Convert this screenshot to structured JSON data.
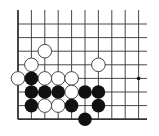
{
  "board": {
    "description": "Go problem diagram, lower-left corner section",
    "columns": 10,
    "rows": 8,
    "edges": {
      "left": true,
      "bottom": true,
      "top": false,
      "right": false
    },
    "origin_x": 18,
    "origin_y": 24,
    "spacing_x": 13.4,
    "spacing_y": 13.6,
    "line_top": 10,
    "line_right": 147,
    "stone_radius": 6.8,
    "colors": {
      "background": "#ffffff",
      "line": "#333333",
      "black_stone": "#111111",
      "white_stone_fill": "#ffffff",
      "white_stone_stroke": "#333333",
      "star_point": "#111111"
    },
    "star_points": [
      {
        "col": 9,
        "row": 4
      }
    ],
    "white_stones": [
      {
        "col": 2,
        "row": 2
      },
      {
        "col": 6,
        "row": 3
      },
      {
        "col": 1,
        "row": 3
      },
      {
        "col": 0,
        "row": 4
      },
      {
        "col": 2,
        "row": 4
      },
      {
        "col": 3,
        "row": 4
      },
      {
        "col": 4,
        "row": 4
      },
      {
        "col": 4,
        "row": 5
      },
      {
        "col": 2,
        "row": 6
      },
      {
        "col": 3,
        "row": 6
      }
    ],
    "black_stones": [
      {
        "col": 1,
        "row": 4
      },
      {
        "col": 1,
        "row": 5
      },
      {
        "col": 2,
        "row": 5
      },
      {
        "col": 3,
        "row": 5
      },
      {
        "col": 5,
        "row": 5
      },
      {
        "col": 6,
        "row": 5
      },
      {
        "col": 1,
        "row": 6
      },
      {
        "col": 4,
        "row": 6
      },
      {
        "col": 6,
        "row": 6
      },
      {
        "col": 5,
        "row": 7
      }
    ]
  }
}
